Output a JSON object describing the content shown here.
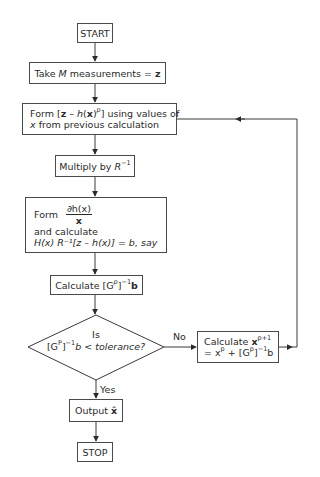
{
  "diagram": {
    "type": "flowchart",
    "colors": {
      "line": "#3a3a3a",
      "text": "#2a2a2a",
      "background": "#ffffff"
    },
    "nodes": {
      "start": {
        "label": "START"
      },
      "measure": {
        "prefix": "Take ",
        "var_M": "M",
        "suffix": " measurements = ",
        "var_z": "z"
      },
      "form_residual": {
        "line1_a": "Form [",
        "z": "z",
        "minus": " – ",
        "h": "h",
        "x": "x",
        "exp": "p",
        "line1_b": "] using values of",
        "line2_var": "x",
        "line2_rest": " from previous calculation"
      },
      "multiply": {
        "prefix": "Multiply by ",
        "R": "R",
        "exp": "−1"
      },
      "form_partial": {
        "form": "Form",
        "num": "∂h(x)",
        "den": "x",
        "line2": "and calculate",
        "line3": "H(x) R⁻¹[z – h(x)] = b, say"
      },
      "calc_g": {
        "prefix": "Calculate [G",
        "exp_p": "p",
        "mid": "]",
        "exp_inv": "−1",
        "b": "b"
      },
      "decision": {
        "line1": "Is",
        "line2_a": "[G",
        "exp_p": "P",
        "line2_b": "]",
        "exp_inv": "−1",
        "line2_c": "b < tolerance?"
      },
      "update": {
        "line1": "Calculate ",
        "x": "x",
        "exp": "p+1",
        "line2_a": "= x",
        "exp2": "p",
        "line2_b": " + [G",
        "exp3": "p",
        "line2_c": "]",
        "exp4": "−1",
        "line2_d": "b"
      },
      "output": {
        "prefix": "Output ",
        "xhat": "x̂"
      },
      "stop": {
        "label": "STOP"
      }
    },
    "edge_labels": {
      "no": "No",
      "yes": "Yes"
    }
  }
}
